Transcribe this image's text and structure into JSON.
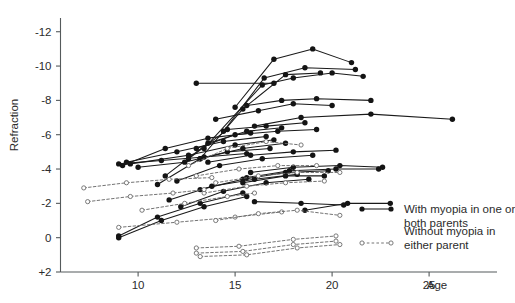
{
  "chart_data": {
    "type": "line",
    "title": "",
    "subtitle": "",
    "xlabel": "Age",
    "ylabel": "Refraction",
    "xlim": [
      6,
      28.5
    ],
    "ylim": [
      2,
      -12.8
    ],
    "grid": false,
    "xticks": [
      10,
      15,
      20,
      25
    ],
    "xtick_labels": [
      "10",
      "15",
      "20",
      "25"
    ],
    "yticks": [
      -12,
      -10,
      -8,
      -6,
      -4,
      -2,
      0,
      2
    ],
    "ytick_labels": [
      "-12",
      "-10",
      "-8",
      "-6",
      "-4",
      "-2",
      "0",
      "+2"
    ],
    "legend_position": "bottom-right",
    "series": [
      {
        "name": "With myopia in one or both parents",
        "label": "With myopia in one or both parents",
        "style": "solid",
        "marker": "filled-circle",
        "color": "#141414",
        "subjects": [
          {
            "x": [
              13.0,
              17.0
            ],
            "y": [
              -9.0,
              -9.0
            ]
          },
          {
            "x": [
              15.0,
              17.0,
              19.0,
              21.0
            ],
            "y": [
              -7.6,
              -10.4,
              -11.0,
              -10.2
            ]
          },
          {
            "x": [
              14.4,
              16.5,
              18.6,
              21.2
            ],
            "y": [
              -6.2,
              -9.3,
              -9.9,
              -9.8
            ]
          },
          {
            "x": [
              13.4,
              16.4,
              18.0,
              20.0,
              21.6
            ],
            "y": [
              -5.2,
              -8.9,
              -9.3,
              -9.6,
              -9.4
            ]
          },
          {
            "x": [
              13.2,
              15.4,
              17.6,
              19.4
            ],
            "y": [
              -4.6,
              -7.5,
              -9.5,
              -9.6
            ]
          },
          {
            "x": [
              15.6,
              17.4,
              19.2,
              22.0
            ],
            "y": [
              -7.7,
              -8.0,
              -8.1,
              -8.0
            ]
          },
          {
            "x": [
              14.0,
              16.2,
              18.0,
              20.0
            ],
            "y": [
              -6.9,
              -7.4,
              -7.8,
              -7.7
            ]
          },
          {
            "x": [
              16.0,
              18.4,
              22.0,
              26.2
            ],
            "y": [
              -6.5,
              -7.0,
              -7.2,
              -6.9
            ]
          },
          {
            "x": [
              12.6,
              14.6,
              16.6,
              18.6
            ],
            "y": [
              -4.6,
              -6.3,
              -6.5,
              -6.7
            ]
          },
          {
            "x": [
              11.4,
              13.6,
              15.6,
              17.4
            ],
            "y": [
              -3.6,
              -5.5,
              -6.2,
              -6.4
            ]
          },
          {
            "x": [
              13.0,
              15.0,
              17.2,
              19.2
            ],
            "y": [
              -5.2,
              -6.0,
              -6.2,
              -6.3
            ]
          },
          {
            "x": [
              9.2,
              11.4,
              13.6,
              15.8
            ],
            "y": [
              -4.2,
              -5.2,
              -5.8,
              -6.1
            ]
          },
          {
            "x": [
              9.4,
              12.0,
              14.4,
              16.6
            ],
            "y": [
              -4.4,
              -5.0,
              -5.6,
              -5.9
            ]
          },
          {
            "x": [
              9.6,
              12.6,
              15.0,
              17.0
            ],
            "y": [
              -4.3,
              -4.8,
              -5.4,
              -5.7
            ]
          },
          {
            "x": [
              11.0,
              13.2,
              15.4,
              17.6
            ],
            "y": [
              -3.1,
              -4.6,
              -5.2,
              -5.5
            ]
          },
          {
            "x": [
              10.0,
              12.4,
              14.6,
              16.8
            ],
            "y": [
              -4.1,
              -4.4,
              -5.0,
              -5.2
            ]
          },
          {
            "x": [
              13.6,
              15.8,
              18.0,
              20.2
            ],
            "y": [
              -4.4,
              -4.8,
              -5.0,
              -5.1
            ]
          },
          {
            "x": [
              12.0,
              14.2,
              16.4,
              19.0
            ],
            "y": [
              -3.3,
              -4.2,
              -4.6,
              -4.8
            ]
          },
          {
            "x": [
              9.0,
              11.2,
              13.4,
              15.6
            ],
            "y": [
              -4.3,
              -4.5,
              -4.7,
              -4.9
            ]
          },
          {
            "x": [
              15.8,
              18.0,
              20.4,
              22.6
            ],
            "y": [
              -3.8,
              -4.1,
              -4.2,
              -4.1
            ]
          },
          {
            "x": [
              15.6,
              17.8,
              20.2,
              22.4
            ],
            "y": [
              -3.5,
              -3.9,
              -4.0,
              -4.0
            ]
          },
          {
            "x": [
              15.4,
              17.6,
              19.6
            ],
            "y": [
              -3.2,
              -3.6,
              -3.6
            ]
          },
          {
            "x": [
              13.2,
              15.4,
              17.6,
              19.8
            ],
            "y": [
              -2.8,
              -3.4,
              -3.8,
              -3.9
            ]
          },
          {
            "x": [
              11.6,
              13.8,
              16.0,
              18.2
            ],
            "y": [
              -2.2,
              -3.0,
              -3.4,
              -3.7
            ]
          },
          {
            "x": [
              12.2,
              14.4,
              16.6,
              18.8
            ],
            "y": [
              -1.8,
              -2.7,
              -3.2,
              -3.4
            ]
          },
          {
            "x": [
              9.0,
              11.0,
              13.2,
              15.4
            ],
            "y": [
              -0.1,
              -1.2,
              -2.0,
              -2.6
            ]
          },
          {
            "x": [
              9.0,
              11.2,
              13.4,
              15.6
            ],
            "y": [
              0.0,
              -1.0,
              -1.8,
              -2.4
            ]
          },
          {
            "x": [
              16.0,
              18.4,
              20.6
            ],
            "y": [
              -2.1,
              -2.0,
              -1.9
            ]
          },
          {
            "x": [
              18.6,
              20.8,
              23.0
            ],
            "y": [
              -1.6,
              -2.0,
              -2.0
            ]
          }
        ]
      },
      {
        "name": "Without myopia in either parent",
        "label": "Without myopia in either parent",
        "style": "dashed",
        "marker": "open-circle",
        "color": "#6b6b6b",
        "subjects": [
          {
            "x": [
              12.6,
              14.6,
              16.6,
              18.4
            ],
            "y": [
              -4.2,
              -5.2,
              -5.6,
              -5.4
            ]
          },
          {
            "x": [
              13.0,
              15.2,
              17.2,
              19.2
            ],
            "y": [
              -3.6,
              -4.0,
              -4.2,
              -4.2
            ]
          },
          {
            "x": [
              14.0,
              16.2,
              18.2,
              20.4
            ],
            "y": [
              -3.2,
              -3.6,
              -3.8,
              -3.8
            ]
          },
          {
            "x": [
              13.4,
              15.6,
              17.6,
              19.6
            ],
            "y": [
              -2.6,
              -3.0,
              -3.2,
              -3.3
            ]
          },
          {
            "x": [
              7.2,
              9.4,
              11.6,
              13.8
            ],
            "y": [
              -2.9,
              -3.2,
              -3.4,
              -3.5
            ]
          },
          {
            "x": [
              7.4,
              9.6,
              11.8,
              13.4
            ],
            "y": [
              -2.1,
              -2.4,
              -2.6,
              -2.8
            ]
          },
          {
            "x": [
              10.2,
              12.4,
              14.6,
              16.0
            ],
            "y": [
              -1.6,
              -2.0,
              -2.4,
              -2.6
            ]
          },
          {
            "x": [
              9.0,
              12.0,
              15.0,
              17.4
            ],
            "y": [
              -0.6,
              -0.9,
              -1.2,
              -1.5
            ]
          },
          {
            "x": [
              14.0,
              16.2,
              18.2,
              20.4
            ],
            "y": [
              -1.0,
              -1.4,
              -1.6,
              -1.3
            ]
          },
          {
            "x": [
              13.0,
              15.2,
              18.0,
              20.2
            ],
            "y": [
              0.6,
              0.5,
              0.1,
              -0.1
            ]
          },
          {
            "x": [
              13.0,
              15.4,
              18.0,
              20.2
            ],
            "y": [
              0.9,
              0.8,
              0.4,
              0.2
            ]
          },
          {
            "x": [
              13.2,
              15.6,
              18.2,
              20.4
            ],
            "y": [
              1.1,
              1.0,
              0.6,
              0.4
            ]
          }
        ]
      }
    ]
  },
  "legend": {
    "entries": [
      {
        "label_line1": "With myopia in one or",
        "label_line2": "both parents",
        "marker": "filled-circle",
        "style": "solid"
      },
      {
        "label_line1": "Without myopia in",
        "label_line2": "either parent",
        "marker": "open-circle",
        "style": "dashed"
      }
    ]
  },
  "axes": {
    "y_title": "Refraction",
    "x_title": "Age"
  }
}
